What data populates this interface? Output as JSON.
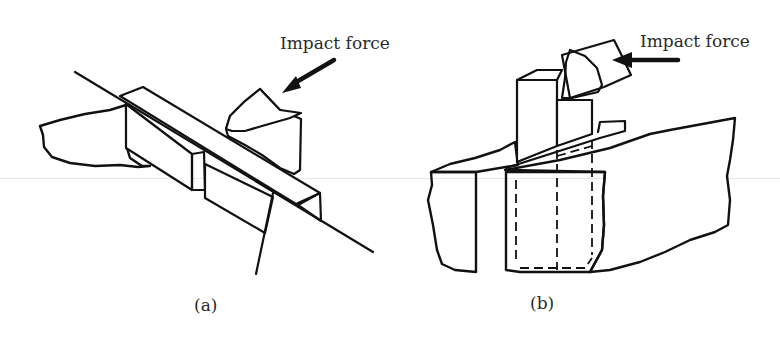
{
  "figure": {
    "panels": [
      {
        "id": "a",
        "caption": "(a)",
        "annotation": "Impact force",
        "arrow_direction": "down-left",
        "description": "Charpy-type specimen: notched bar supported at both ends, striker impacting center"
      },
      {
        "id": "b",
        "caption": "(b)",
        "annotation": "Impact force",
        "arrow_direction": "left",
        "description": "Izod-type specimen: cantilever bar clamped in vise, striker impacting upper end"
      }
    ],
    "colors": {
      "line": "#111111",
      "stipple": "#8a8a8a",
      "background": "#ffffff",
      "text": "#2a2a2a"
    }
  }
}
